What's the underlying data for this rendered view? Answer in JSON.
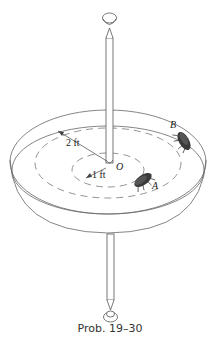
{
  "figure": {
    "caption": "Prob. 19–30",
    "labels": {
      "outer_radius": "2 ft",
      "inner_radius": "1 ft",
      "center": "O",
      "point_a": "A",
      "point_b": "B"
    },
    "objects": {
      "shaft": "vertical-shaft",
      "dish": "rotating-dish",
      "bug_a": "beetle-at-A",
      "bug_b": "beetle-at-B"
    },
    "colors": {
      "line": "#555555",
      "dash": "#777777",
      "bug": "#333333",
      "background": "#ffffff"
    }
  }
}
